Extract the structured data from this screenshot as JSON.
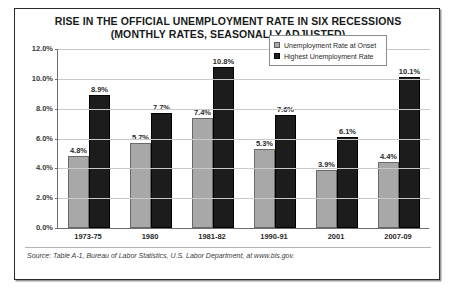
{
  "chart_data": {
    "type": "bar",
    "title": "RISE IN THE OFFICIAL UNEMPLOYMENT RATE IN SIX RECESSIONS",
    "subtitle": "(MONTHLY RATES, SEASONALLY ADJUSTED)",
    "xlabel": "",
    "ylabel": "",
    "ylim": [
      0,
      12
    ],
    "ytick_labels": [
      "12.0%",
      "10.0%",
      "8.0%",
      "6.0%",
      "4.0%",
      "2.0%",
      "0.0%"
    ],
    "ytick_values": [
      12,
      10,
      8,
      6,
      4,
      2,
      0
    ],
    "grid": true,
    "legend_position": "top-right",
    "categories": [
      "1973-75",
      "1980",
      "1981-82",
      "1990-91",
      "2001",
      "2007-09"
    ],
    "series": [
      {
        "name": "Unemployment Rate at Onset",
        "color": "#a8a8a8",
        "values": [
          4.8,
          5.7,
          7.4,
          5.3,
          3.9,
          4.4
        ],
        "labels": [
          "4.8%",
          "5.7%",
          "7.4%",
          "5.3%",
          "3.9%",
          "4.4%"
        ]
      },
      {
        "name": "Highest Unemployment Rate",
        "color": "#1c1c1c",
        "values": [
          8.9,
          7.7,
          10.8,
          7.6,
          6.1,
          10.1
        ],
        "labels": [
          "8.9%",
          "7.7%",
          "10.8%",
          "7.6%",
          "6.1%",
          "10.1%"
        ]
      }
    ]
  },
  "source": {
    "text": "Source: Table A-1, Bureau of Labor Statistics, U.S. Labor Department, at www.bls.gov."
  }
}
